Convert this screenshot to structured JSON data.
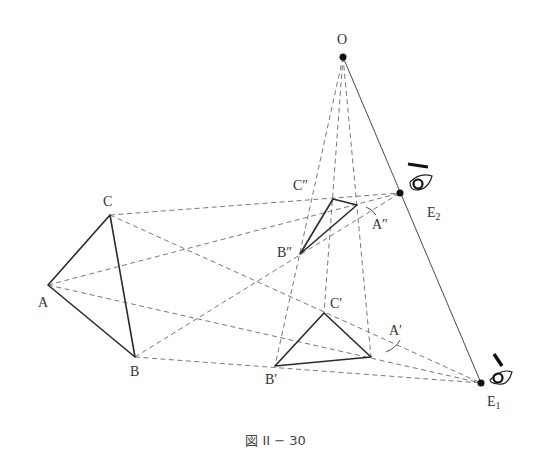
{
  "caption": "図 II − 30",
  "labels": {
    "O": "O",
    "A": "A",
    "B": "B",
    "C": "C",
    "A1": "A′",
    "B1": "B′",
    "C1": "C′",
    "A2": "A″",
    "B2": "B″",
    "C2": "C″",
    "E1": "E",
    "E1_sub": "1",
    "E2": "E",
    "E2_sub": "2"
  },
  "icons": [
    "eye-icon-e1",
    "eye-icon-e2",
    "point-o",
    "point-e1",
    "point-e2"
  ]
}
